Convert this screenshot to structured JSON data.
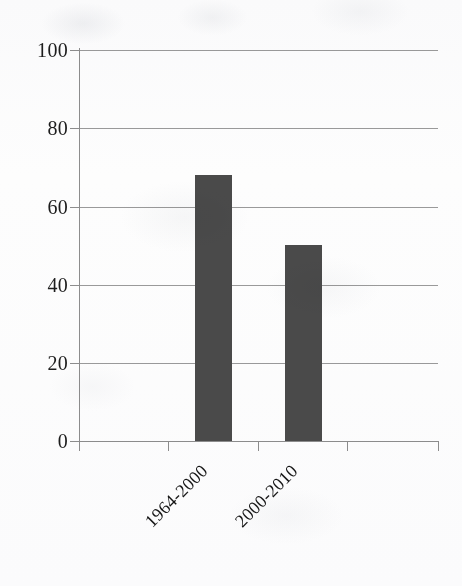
{
  "chart_data": {
    "type": "bar",
    "title": "",
    "subtitle": "",
    "xlabel": "",
    "ylabel": "",
    "categories": [
      "1964-2000",
      "2000-2010"
    ],
    "values": [
      68,
      50
    ],
    "series": [
      {
        "name": "",
        "values": [
          68,
          50
        ]
      }
    ],
    "ylim": [
      0,
      100
    ],
    "y_ticks": [
      0,
      20,
      40,
      60,
      80,
      100
    ],
    "y_tick_labels": [
      "0",
      "20",
      "40",
      "60",
      "80",
      "100"
    ],
    "grid": true,
    "grid_axis": "y",
    "legend": false,
    "legend_position": "none",
    "x_tick_count": 4,
    "bar_color": "#4a4a4a",
    "gridline_color": "#9a9a9a",
    "axis_color": "#8d8d8d",
    "text_color": "#1d1d1d",
    "background_color": "#fdfdfd",
    "x_label_rotation": -45,
    "annotations": []
  }
}
